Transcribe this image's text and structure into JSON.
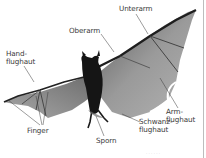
{
  "diagram": {
    "labels": {
      "oberarm": "Oberarm",
      "unterarm": "Unterarm",
      "handflughaut": [
        "Hand-",
        "flughaut"
      ],
      "armflughaut": [
        "Arm-",
        "flughaut"
      ],
      "schwanzflughaut": [
        "Schwanz-",
        "flughaut"
      ],
      "finger": "Finger",
      "sporn": "Sporn"
    },
    "caption": "· · · · · ·",
    "colors": {
      "background": "#ffffff",
      "label_text": "#3a3a3a",
      "leader_line": "#333333",
      "body": "#1a1a1a",
      "membrane": "#8f8f8f",
      "border": "#bdbdbd"
    }
  }
}
